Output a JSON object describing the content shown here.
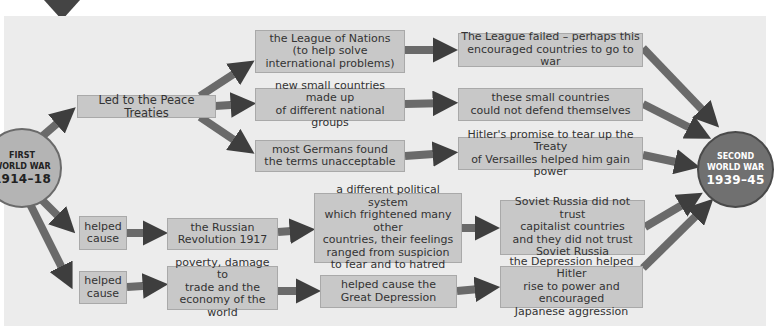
{
  "diagram": {
    "type": "cause-and-effect flowchart",
    "colors": {
      "panel_bg": "#ececec",
      "box_fill": "#c8c8c8",
      "arrow": "#4a4a4a",
      "start_circle": "#b4b4b4",
      "end_circle": "#707070"
    },
    "start_node": {
      "line1": "FIRST",
      "line2": "WORLD WAR",
      "line3": "1914–18"
    },
    "end_node": {
      "line1": "SECOND",
      "line2": "WORLD WAR",
      "line3": "1939–45"
    },
    "boxes": {
      "peace_treaties": "Led to the Peace Treaties",
      "league_of_nations": "the League of Nations\n(to help solve\ninternational problems)",
      "new_small_countries": "new small countries made up\nof different national groups",
      "germans_unacceptable": "most Germans found\nthe terms unacceptable",
      "league_failed": "The League failed – perhaps this\nencouraged countries to go to war",
      "cannot_defend": "these small countries\ncould not defend themselves",
      "hitler_promise": "Hitler's promise to tear up the Treaty\nof Versailles helped him gain power",
      "helped_cause_1": "helped\ncause",
      "russian_revolution": "the Russian\nRevolution 1917",
      "political_system": "a different political system\nwhich frightened many other\ncountries, their feelings\nranged from suspicion\nto fear and to hatred",
      "soviet_distrust": "Soviet Russia did not trust\ncapitalist countries\nand they did not trust\nSoviet Russia",
      "helped_cause_2": "helped\ncause",
      "poverty": "poverty, damage to\ntrade and the\neconomy of the world",
      "great_depression": "helped cause the\nGreat Depression",
      "depression_hitler": "the Depression helped Hitler\nrise to power and encouraged\nJapanese aggression"
    }
  }
}
